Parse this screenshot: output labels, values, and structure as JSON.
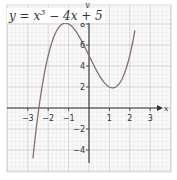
{
  "chart_data": {
    "type": "line",
    "title_parts": {
      "lhs": "y = x",
      "exp": "3",
      "rhs": " − 4x + 5"
    },
    "xlabel": "x",
    "ylabel": "y",
    "xlim": [
      -3.4,
      3.4
    ],
    "ylim": [
      -6,
      9.5
    ],
    "x_ticks": [
      -3,
      -2,
      -1,
      1,
      2,
      3
    ],
    "x_tick_labels": [
      "−3",
      "−2",
      "−1",
      "1",
      "2",
      "3"
    ],
    "y_ticks": [
      -4,
      -2,
      2,
      4,
      6,
      8
    ],
    "y_tick_labels": [
      "−4",
      "−2",
      "2",
      "4",
      "6",
      "8"
    ],
    "grid": true,
    "series": [
      {
        "name": "y = x^3 - 4x + 5",
        "function": "x^3 - 4x + 5",
        "x_range": [
          -2.75,
          2.25
        ],
        "x": [
          -2.75,
          -2.5,
          -2,
          -1.5,
          -1.15,
          -1,
          -0.5,
          0,
          0.5,
          1,
          1.15,
          1.5,
          2,
          2.25
        ],
        "values": [
          -4.8,
          0.4,
          5,
          7.6,
          8.1,
          8,
          6.9,
          5,
          3.1,
          2,
          1.9,
          2.4,
          5,
          7.4
        ]
      }
    ],
    "colors": {
      "curve": "#8a6d70",
      "axis": "#333333",
      "grid_major": "#c8c8c8",
      "grid_minor": "#e6e6e6"
    }
  }
}
